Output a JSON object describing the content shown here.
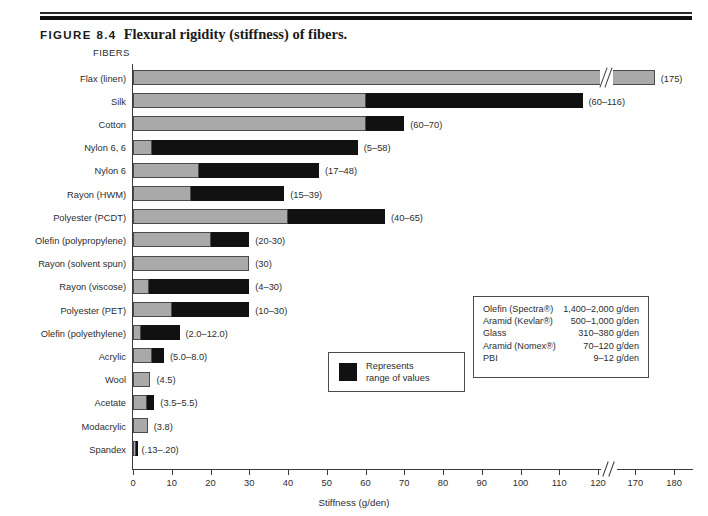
{
  "header": {
    "figure_number": "FIGURE 8.4",
    "caption": "Flexural rigidity (stiffness) of fibers."
  },
  "chart_data": {
    "type": "bar",
    "orientation": "horizontal",
    "title": "Flexural rigidity (stiffness) of fibers.",
    "xlabel": "Stiffness (g/den)",
    "ylabel": "FIBERS",
    "xlim": [
      0,
      180
    ],
    "axis_break": {
      "after": 120,
      "resume": 165
    },
    "xticks": [
      0,
      10,
      20,
      30,
      40,
      50,
      60,
      70,
      80,
      90,
      100,
      110,
      120,
      170,
      180
    ],
    "grid": false,
    "legend": {
      "swatch_color": "#111111",
      "line1": "Represents",
      "line2": "range of values"
    },
    "colors": {
      "base": "#a9a9a9",
      "range": "#111111",
      "outline": "#4a4a4a"
    },
    "categories": [
      "Flax (linen)",
      "Silk",
      "Cotton",
      "Nylon 6, 6",
      "Nylon 6",
      "Rayon (HWM)",
      "Polyester (PCDT)",
      "Olefin (polypropylene)",
      "Rayon (solvent spun)",
      "Rayon (viscose)",
      "Polyester (PET)",
      "Olefin (polyethylene)",
      "Acrylic",
      "Wool",
      "Acetate",
      "Modacrylic",
      "Spandex"
    ],
    "bars": [
      {
        "label": "Flax (linen)",
        "min": 175,
        "max": 175,
        "value_text": "(175)",
        "broken": true
      },
      {
        "label": "Silk",
        "min": 60,
        "max": 116,
        "value_text": "(60–116)",
        "broken": false
      },
      {
        "label": "Cotton",
        "min": 60,
        "max": 70,
        "value_text": "(60–70)",
        "broken": false
      },
      {
        "label": "Nylon 6, 6",
        "min": 5,
        "max": 58,
        "value_text": "(5–58)",
        "broken": false
      },
      {
        "label": "Nylon 6",
        "min": 17,
        "max": 48,
        "value_text": "(17–48)",
        "broken": false
      },
      {
        "label": "Rayon (HWM)",
        "min": 15,
        "max": 39,
        "value_text": "(15–39)",
        "broken": false
      },
      {
        "label": "Polyester (PCDT)",
        "min": 40,
        "max": 65,
        "value_text": "(40–65)",
        "broken": false
      },
      {
        "label": "Olefin (polypropylene)",
        "min": 20,
        "max": 30,
        "value_text": "(20-30)",
        "broken": false
      },
      {
        "label": "Rayon (solvent spun)",
        "min": 30,
        "max": 30,
        "value_text": "(30)",
        "broken": false
      },
      {
        "label": "Rayon (viscose)",
        "min": 4,
        "max": 30,
        "value_text": "(4–30)",
        "broken": false
      },
      {
        "label": "Polyester (PET)",
        "min": 10,
        "max": 30,
        "value_text": "(10–30)",
        "broken": false
      },
      {
        "label": "Olefin (polyethylene)",
        "min": 2.0,
        "max": 12.0,
        "value_text": "(2.0–12.0)",
        "broken": false
      },
      {
        "label": "Acrylic",
        "min": 5.0,
        "max": 8.0,
        "value_text": "(5.0–8.0)",
        "broken": false
      },
      {
        "label": "Wool",
        "min": 4.5,
        "max": 4.5,
        "value_text": "(4.5)",
        "broken": false
      },
      {
        "label": "Acetate",
        "min": 3.5,
        "max": 5.5,
        "value_text": "(3.5–5.5)",
        "broken": false
      },
      {
        "label": "Modacrylic",
        "min": 3.8,
        "max": 3.8,
        "value_text": "(3.8)",
        "broken": false
      },
      {
        "label": "Spandex",
        "min": 0.13,
        "max": 0.2,
        "value_text": "(.13–.20)",
        "broken": false
      }
    ],
    "annotations": {
      "side_table_rows": [
        {
          "name": "Olefin (Spectra®)",
          "value": "1,400–2,000 g/den"
        },
        {
          "name": "Aramid (Kevlar®)",
          "value": "500–1,000 g/den"
        },
        {
          "name": "Glass",
          "value": "310–380 g/den"
        },
        {
          "name": "Aramid (Nomex®)",
          "value": "70–120 g/den"
        },
        {
          "name": "PBI",
          "value": "9–12 g/den"
        }
      ]
    }
  }
}
